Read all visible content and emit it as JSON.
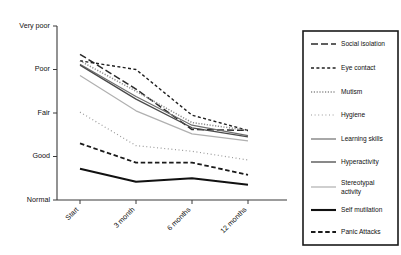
{
  "chart_data": {
    "type": "line",
    "title": "",
    "xlabel": "",
    "ylabel": "",
    "categories": [
      "Start",
      "3 month",
      "6 months",
      "12 months"
    ],
    "y_tick_labels": [
      "Very poor",
      "Poor",
      "Fair",
      "Good",
      "Normal"
    ],
    "y_scale_values": [
      5,
      4,
      3,
      2,
      1
    ],
    "ylim": [
      1,
      5
    ],
    "grid": false,
    "legend_position": "right",
    "series": [
      {
        "name": "Social isolation",
        "values": [
          4.35,
          3.55,
          2.62,
          2.6
        ],
        "style": "long-dash",
        "color": "#2b2b2b",
        "width": 1.5,
        "dash": "7,3"
      },
      {
        "name": "Eye contact",
        "values": [
          4.2,
          4.0,
          2.95,
          2.6
        ],
        "style": "dashed",
        "color": "#1f1f1f",
        "width": 1.4,
        "dash": "3,2.4"
      },
      {
        "name": "Mutism",
        "values": [
          4.2,
          3.5,
          2.78,
          2.6
        ],
        "style": "dotted-fine",
        "color": "#8c8c8c",
        "width": 1.5,
        "dash": "1.2,1.6"
      },
      {
        "name": "Hygiene",
        "values": [
          3.02,
          2.25,
          2.12,
          1.92
        ],
        "style": "dotted-sparse",
        "color": "#9a9a9a",
        "width": 1.2,
        "dash": "1,2.6"
      },
      {
        "name": "Learning skills",
        "values": [
          4.12,
          3.38,
          2.72,
          2.48
        ],
        "style": "solid",
        "color": "#6e6e6e",
        "width": 1.2,
        "dash": "none"
      },
      {
        "name": "Hyperactivity",
        "values": [
          4.1,
          3.32,
          2.66,
          2.45
        ],
        "style": "solid",
        "color": "#4a4a4a",
        "width": 1.3,
        "dash": "none"
      },
      {
        "name": "Stereotypal activity",
        "values": [
          3.86,
          3.05,
          2.52,
          2.36
        ],
        "style": "solid-light",
        "color": "#b0b0b0",
        "width": 1.2,
        "dash": "none"
      },
      {
        "name": "Self mutilation",
        "values": [
          1.72,
          1.42,
          1.5,
          1.35
        ],
        "style": "solid-thick",
        "color": "#111111",
        "width": 2.1,
        "dash": "none"
      },
      {
        "name": "Panic Attacks",
        "values": [
          2.3,
          1.86,
          1.86,
          1.58
        ],
        "style": "dashed-thick",
        "color": "#1a1a1a",
        "width": 1.8,
        "dash": "4.5,2.6"
      }
    ]
  },
  "legend": {
    "items": [
      {
        "label": "Social isolation"
      },
      {
        "label": "Eye contact"
      },
      {
        "label": "Mutism"
      },
      {
        "label": "Hygiene"
      },
      {
        "label": "Learning skills"
      },
      {
        "label": "Hyperactivity"
      },
      {
        "label": "Stereotypal activity"
      },
      {
        "label": "Self mutilation"
      },
      {
        "label": "Panic Attacks"
      }
    ]
  }
}
